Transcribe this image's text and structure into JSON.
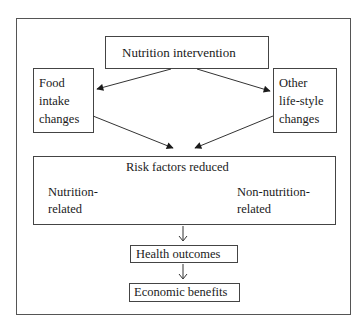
{
  "diagram": {
    "nodes": {
      "intervention": "Nutrition intervention",
      "food_intake": [
        "Food",
        "intake",
        "changes"
      ],
      "lifestyle": [
        "Other",
        "life-style",
        "changes"
      ],
      "risk_factors": {
        "title": "Risk factors reduced",
        "left": [
          "Nutrition-",
          "related"
        ],
        "right": [
          "Non-nutrition-",
          "related"
        ]
      },
      "health": "Health outcomes",
      "economic": "Economic benefits"
    },
    "edges": [
      {
        "from": "Nutrition intervention",
        "to": "Food intake changes"
      },
      {
        "from": "Nutrition intervention",
        "to": "Other life-style changes"
      },
      {
        "from": "Food intake changes",
        "to": "Risk factors reduced"
      },
      {
        "from": "Other life-style changes",
        "to": "Risk factors reduced"
      },
      {
        "from": "Risk factors reduced",
        "to": "Health outcomes"
      },
      {
        "from": "Health outcomes",
        "to": "Economic benefits"
      }
    ]
  }
}
